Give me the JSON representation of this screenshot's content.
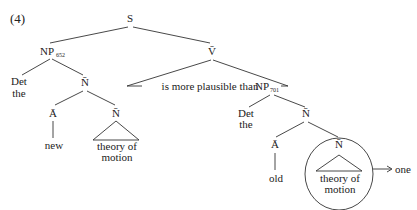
{
  "example_number": "(4)",
  "tree": {
    "root": "S",
    "np_subject": {
      "label": "NP",
      "index": "652"
    },
    "det_left": {
      "label": "Det",
      "word": "the"
    },
    "nbar_left": "N̄",
    "abar_left": {
      "label": "Ā",
      "word": "new"
    },
    "nbar_left_inner": {
      "label": "N̄",
      "words": [
        "theory of",
        "motion"
      ]
    },
    "vbar": "V̄",
    "vbar_text": "is more plausible than",
    "np_object": {
      "label": "NP",
      "index": "701"
    },
    "det_right": {
      "label": "Det",
      "word": "the"
    },
    "nbar_right": "N̄",
    "abar_right": {
      "label": "Ā",
      "word": "old"
    },
    "nbar_right_inner": {
      "label": "N̄",
      "words": [
        "theory of",
        "motion"
      ],
      "circled": true
    },
    "replacement": {
      "arrow": "→",
      "word": "one"
    }
  }
}
